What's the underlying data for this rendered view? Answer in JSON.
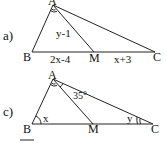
{
  "figures": [
    {
      "id": "a",
      "part_label": "a)",
      "vertices": {
        "A": "A",
        "B": "B",
        "M": "M",
        "C": "C"
      },
      "segment_labels": {
        "AM": "y-1",
        "BM": "2x-4",
        "MC": "x+3"
      }
    },
    {
      "id": "c",
      "part_label": "c)",
      "vertices": {
        "A": "A",
        "B": "B",
        "M": "M",
        "C": "C"
      },
      "angle_labels": {
        "MAC": "35°",
        "B": "x",
        "C": "y"
      }
    }
  ]
}
